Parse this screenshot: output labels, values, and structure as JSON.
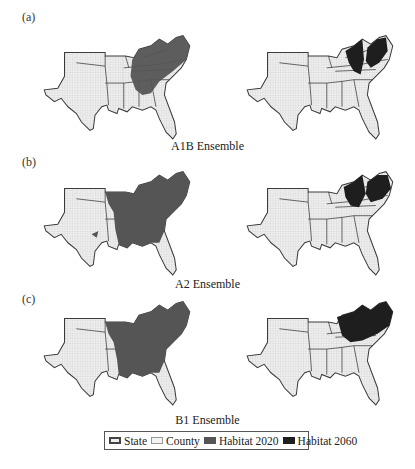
{
  "figure": {
    "panels": [
      {
        "label": "(a)",
        "caption": "A1B Ensemble"
      },
      {
        "label": "(b)",
        "caption": "A2 Ensemble"
      },
      {
        "label": "(c)",
        "caption": "B1 Ensemble"
      }
    ],
    "columns": [
      "Habitat 2020",
      "Habitat 2060"
    ]
  },
  "legend": {
    "items": [
      {
        "label": "State",
        "swatch": "state"
      },
      {
        "label": "County",
        "swatch": "county"
      },
      {
        "label": "Habitat 2020",
        "swatch": "h2020"
      },
      {
        "label": "Habitat 2060",
        "swatch": "h2060"
      }
    ]
  },
  "colors": {
    "county_fill": "#e6e6e6",
    "state_border": "#3a3a3a",
    "habitat_2020": "#555555",
    "habitat_2060": "#1e1e1e"
  }
}
